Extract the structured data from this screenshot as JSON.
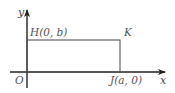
{
  "diagram": {
    "type": "coordinate-geometry",
    "axes": {
      "x_label": "x",
      "y_label": "y",
      "origin_label": "O"
    },
    "points": {
      "H": {
        "label": "H(0, b)"
      },
      "K": {
        "label": "K"
      },
      "J": {
        "label": "J(a, 0)"
      }
    },
    "colors": {
      "axis": "#222222",
      "rectangle": "#555555",
      "text": "#444444"
    }
  }
}
